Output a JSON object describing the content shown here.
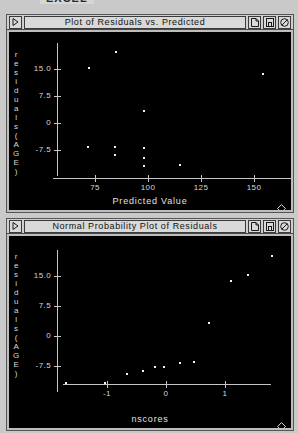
{
  "app": {
    "banner": "EXCEL"
  },
  "windows": [
    {
      "id": "residuals",
      "title": "Plot of Residuals vs. Predicted",
      "menu_icon": "play-triangle-icon",
      "buttons": [
        {
          "name": "page-icon",
          "label": "⎙"
        },
        {
          "name": "save-floppy-icon",
          "label": "▣"
        },
        {
          "name": "no-entry-icon",
          "label": "⊘"
        }
      ]
    },
    {
      "id": "normal",
      "title": "Normal Probability Plot of Residuals",
      "menu_icon": "play-triangle-icon",
      "buttons": [
        {
          "name": "page-icon",
          "label": "⎙"
        },
        {
          "name": "save-floppy-icon",
          "label": "▣"
        },
        {
          "name": "no-entry-icon",
          "label": "⊘"
        }
      ]
    }
  ],
  "chart_data": [
    {
      "type": "scatter",
      "title": "Plot of Residuals vs. Predicted",
      "xlabel": "Predicted Value",
      "ylabel": "residuals(AGE)",
      "ylabel_chars": [
        "r",
        "e",
        "s",
        "i",
        "d",
        "u",
        "a",
        "l",
        "s",
        "(",
        "A",
        "G",
        "E",
        ")"
      ],
      "xticks": [
        75,
        100,
        125,
        150
      ],
      "xticklabels": [
        "75",
        "100",
        "125",
        "150"
      ],
      "yticks": [
        15.0,
        7.5,
        0,
        -7.5
      ],
      "yticklabels": [
        "15.0",
        "7.5",
        "0",
        "-7.5"
      ],
      "xlim": [
        57,
        163
      ],
      "ylim": [
        -13.5,
        21.5
      ],
      "grid": false,
      "legend": false,
      "points": [
        {
          "x": 71.5,
          "y": 15.6
        },
        {
          "x": 84.5,
          "y": 20.2
        },
        {
          "x": 71.0,
          "y": -6.4
        },
        {
          "x": 84.0,
          "y": -6.2
        },
        {
          "x": 84.0,
          "y": -8.6
        },
        {
          "x": 97.5,
          "y": 3.6
        },
        {
          "x": 97.5,
          "y": -6.5
        },
        {
          "x": 97.5,
          "y": -9.3
        },
        {
          "x": 97.5,
          "y": -11.6
        },
        {
          "x": 114.5,
          "y": -11.4
        },
        {
          "x": 154.0,
          "y": 14.0
        }
      ]
    },
    {
      "type": "scatter",
      "title": "Normal Probability Plot of Residuals",
      "xlabel": "nscores",
      "ylabel": "residuals(AGE)",
      "ylabel_chars": [
        "r",
        "e",
        "s",
        "i",
        "d",
        "u",
        "a",
        "l",
        "s",
        "(",
        "A",
        "G",
        "E",
        ")"
      ],
      "xticks": [
        -1,
        0,
        1
      ],
      "xticklabels": [
        "-1",
        "0",
        "1"
      ],
      "yticks": [
        15.0,
        7.5,
        0,
        -7.5
      ],
      "yticklabels": [
        "15.0",
        "7.5",
        "0",
        "-7.5"
      ],
      "xlim": [
        -1.85,
        1.95
      ],
      "ylim": [
        -13.5,
        21.5
      ],
      "grid": false,
      "legend": false,
      "points": [
        {
          "x": -1.72,
          "y": -11.6
        },
        {
          "x": -1.05,
          "y": -11.4
        },
        {
          "x": -0.68,
          "y": -9.3
        },
        {
          "x": -0.4,
          "y": -8.6
        },
        {
          "x": -0.2,
          "y": -7.6
        },
        {
          "x": -0.05,
          "y": -7.4
        },
        {
          "x": 0.22,
          "y": -6.5
        },
        {
          "x": 0.45,
          "y": -6.2
        },
        {
          "x": 0.72,
          "y": 3.6
        },
        {
          "x": 1.08,
          "y": 14.0
        },
        {
          "x": 1.38,
          "y": 15.6
        },
        {
          "x": 1.78,
          "y": 20.2
        }
      ]
    }
  ]
}
